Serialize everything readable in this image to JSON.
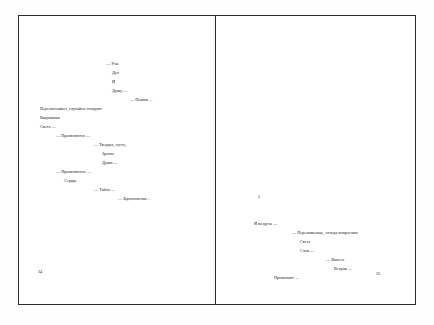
{
  "document": {
    "type": "poetry-book-spread",
    "language": "ru"
  },
  "left_page": {
    "folio": "34",
    "lines": [
      {
        "text": "— Узы",
        "x": 88,
        "y": 47
      },
      {
        "text": "Дух",
        "x": 94,
        "y": 56
      },
      {
        "text": "И",
        "x": 94,
        "y": 65
      },
      {
        "text": "Душу —",
        "x": 94,
        "y": 74
      },
      {
        "text": "— Пожми ...",
        "x": 112,
        "y": 83
      },
      {
        "text": "Перелистывает, случайно танцуют",
        "x": 22,
        "y": 92
      },
      {
        "text": "Видимыми",
        "x": 22,
        "y": 101
      },
      {
        "text": "Света —",
        "x": 22,
        "y": 110
      },
      {
        "text": "— Проявляются —",
        "x": 38,
        "y": 119
      },
      {
        "text": "— Твердая, густо,",
        "x": 76,
        "y": 128
      },
      {
        "text": "Зрячие",
        "x": 84,
        "y": 137
      },
      {
        "text": "Души —",
        "x": 84,
        "y": 146
      },
      {
        "text": "— Проявляются: —",
        "x": 38,
        "y": 155
      },
      {
        "text": "Сердце",
        "x": 46,
        "y": 164
      },
      {
        "text": "— Тайна —",
        "x": 76,
        "y": 173
      },
      {
        "text": "— Вдохновения ..",
        "x": 100,
        "y": 182
      }
    ]
  },
  "right_page": {
    "folio": "35",
    "section_marker": {
      "text": "5",
      "x": 42,
      "y": 180
    },
    "lines": [
      {
        "text": "И воздуха —",
        "x": 38,
        "y": 207
      },
      {
        "text": "— Переливаемые, отходя вопросами",
        "x": 76,
        "y": 216
      },
      {
        "text": "Света",
        "x": 84,
        "y": 225
      },
      {
        "text": "Слов —",
        "x": 84,
        "y": 234
      },
      {
        "text": "— Вынете",
        "x": 110,
        "y": 243
      },
      {
        "text": "Ветров —",
        "x": 118,
        "y": 252
      },
      {
        "text": "Проявляют —",
        "x": 58,
        "y": 261
      }
    ]
  }
}
